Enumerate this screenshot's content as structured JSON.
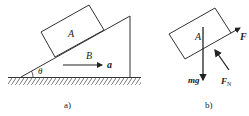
{
  "figure_a": {
    "caption": "a)",
    "block_label": "A",
    "wedge_label": "B",
    "angle_label": "θ",
    "acceleration_label": "a"
  },
  "figure_b": {
    "caption": "b)",
    "block_label": "A",
    "force_tension": "F",
    "force_gravity": "mg",
    "force_normal": "F",
    "force_normal_sub": "N"
  },
  "colors": {
    "line": "#333333"
  }
}
